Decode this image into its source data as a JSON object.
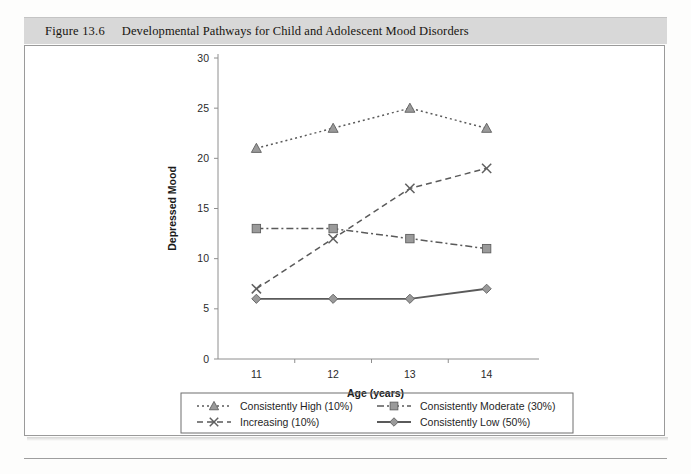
{
  "figure": {
    "number": "Figure 13.6",
    "title": "Developmental Pathways for Child and Adolescent Mood Disorders"
  },
  "colors": {
    "marker_fill": "#9a9a9a",
    "marker_stroke": "#5f5f5f",
    "line": "#5a5a5a",
    "axis": "#8e8e8e",
    "caption_band": "#d8d8d8",
    "panel_border": "#9a9a9a"
  },
  "chart_data": {
    "type": "line",
    "title": "",
    "xlabel": "Age (years)",
    "ylabel": "Depressed Mood",
    "x": [
      11,
      12,
      13,
      14
    ],
    "xtick_labels": [
      "11",
      "12",
      "13",
      "14"
    ],
    "ytick_labels": [
      "0",
      "5",
      "10",
      "15",
      "20",
      "25",
      "30"
    ],
    "yticks": [
      0,
      5,
      10,
      15,
      20,
      25,
      30
    ],
    "xlim": [
      10.5,
      14.5
    ],
    "ylim": [
      0,
      30
    ],
    "grid": false,
    "legend_position": "bottom",
    "series": [
      {
        "name": "Consistently High (10%)",
        "values": [
          21,
          23,
          25,
          23
        ],
        "marker": "triangle",
        "dash": "2,3"
      },
      {
        "name": "Consistently Moderate (30%)",
        "values": [
          13,
          13,
          12,
          11
        ],
        "marker": "square",
        "dash": "7,3,2,3"
      },
      {
        "name": "Increasing (10%)",
        "values": [
          7,
          12,
          17,
          19
        ],
        "marker": "cross",
        "dash": "6,4"
      },
      {
        "name": "Consistently Low (50%)",
        "values": [
          6,
          6,
          6,
          7
        ],
        "marker": "diamond",
        "dash": "none"
      }
    ]
  }
}
